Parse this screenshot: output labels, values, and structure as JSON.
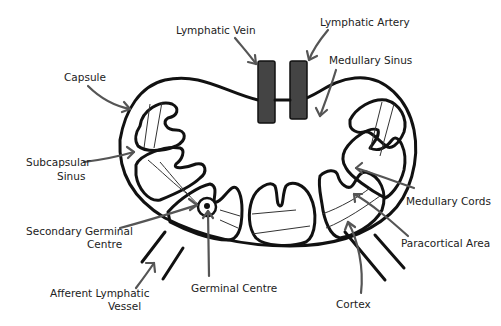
{
  "colors": {
    "outline": "#111111",
    "vessel_fill": "#444444",
    "arrow": "#555555",
    "label_text": "#222222",
    "background": "#ffffff"
  },
  "labels": {
    "lymphatic_vein": "Lymphatic Vein",
    "lymphatic_artery": "Lymphatic Artery",
    "medullary_sinus": "Medullary Sinus",
    "capsule": "Capsule",
    "subcapsular_sinus_line1": "Subcapsular",
    "subcapsular_sinus_line2": "Sinus",
    "medullary_cords": "Medullary Cords",
    "secondary_germinal_centre_line1": "Secondary Germinal",
    "secondary_germinal_centre_line2": "Centre",
    "paracortical_area": "Paracortical Area",
    "afferent_lymphatic_vessel_line1": "Afferent Lymphatic",
    "afferent_lymphatic_vessel_line2": "Vessel",
    "germinal_centre": "Germinal Centre",
    "cortex": "Cortex"
  }
}
